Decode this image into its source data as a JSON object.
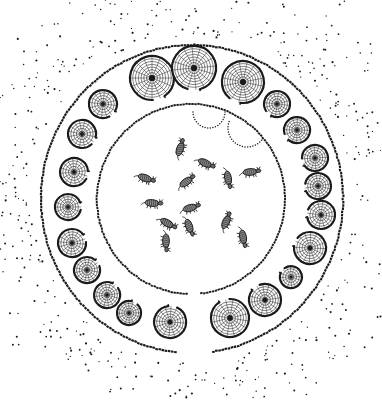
{
  "figure": {
    "width": 382,
    "height": 401,
    "background": "#ffffff",
    "ink": "#1a1a1a"
  },
  "outer_enclosure": {
    "cx": 192,
    "cy": 199,
    "rx": 151,
    "ry": 154,
    "gap_start_deg": 82,
    "gap_end_deg": 96,
    "dot_spacing": 3.2,
    "dot_r": 1.3
  },
  "inner_enclosure": {
    "cx": 191,
    "cy": 199,
    "rx": 94,
    "ry": 95,
    "gap_start_deg": 84,
    "gap_end_deg": 91,
    "dot_spacing": 3.0,
    "dot_r": 1.2
  },
  "doorway_arcs": [
    {
      "cx": 209,
      "cy": 112,
      "r": 16,
      "start_deg": 0,
      "end_deg": 180
    },
    {
      "cx": 247,
      "cy": 128,
      "r": 19,
      "start_deg": 40,
      "end_deg": 200
    }
  ],
  "huts": [
    {
      "cx": 152,
      "cy": 78,
      "r": 22
    },
    {
      "cx": 194,
      "cy": 68,
      "r": 22
    },
    {
      "cx": 243,
      "cy": 82,
      "r": 21
    },
    {
      "cx": 277,
      "cy": 104,
      "r": 13
    },
    {
      "cx": 297,
      "cy": 130,
      "r": 13
    },
    {
      "cx": 315,
      "cy": 158,
      "r": 13
    },
    {
      "cx": 318,
      "cy": 186,
      "r": 13
    },
    {
      "cx": 321,
      "cy": 215,
      "r": 14
    },
    {
      "cx": 310,
      "cy": 248,
      "r": 16
    },
    {
      "cx": 291,
      "cy": 277,
      "r": 11
    },
    {
      "cx": 265,
      "cy": 300,
      "r": 16
    },
    {
      "cx": 230,
      "cy": 318,
      "r": 19
    },
    {
      "cx": 170,
      "cy": 322,
      "r": 16
    },
    {
      "cx": 129,
      "cy": 313,
      "r": 12
    },
    {
      "cx": 107,
      "cy": 295,
      "r": 13
    },
    {
      "cx": 87,
      "cy": 270,
      "r": 13
    },
    {
      "cx": 72,
      "cy": 243,
      "r": 14
    },
    {
      "cx": 68,
      "cy": 207,
      "r": 13
    },
    {
      "cx": 74,
      "cy": 172,
      "r": 14
    },
    {
      "cx": 82,
      "cy": 134,
      "r": 14
    },
    {
      "cx": 103,
      "cy": 104,
      "r": 14
    }
  ],
  "animals": [
    {
      "x": 180,
      "y": 149,
      "angle": -70
    },
    {
      "x": 205,
      "y": 163,
      "angle": 25
    },
    {
      "x": 228,
      "y": 178,
      "angle": 80
    },
    {
      "x": 250,
      "y": 172,
      "angle": -5
    },
    {
      "x": 145,
      "y": 178,
      "angle": 20
    },
    {
      "x": 186,
      "y": 182,
      "angle": -35
    },
    {
      "x": 152,
      "y": 203,
      "angle": 5
    },
    {
      "x": 190,
      "y": 208,
      "angle": -15
    },
    {
      "x": 167,
      "y": 223,
      "angle": 30
    },
    {
      "x": 189,
      "y": 226,
      "angle": 70
    },
    {
      "x": 226,
      "y": 222,
      "angle": -65
    },
    {
      "x": 166,
      "y": 241,
      "angle": 90
    },
    {
      "x": 243,
      "y": 237,
      "angle": 80
    }
  ],
  "scatter": {
    "count": 420,
    "seed": 7,
    "min_r_from_center": 160,
    "max_r_from_center": 235
  }
}
